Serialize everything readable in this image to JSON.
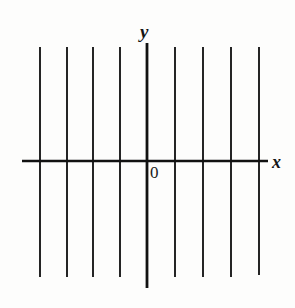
{
  "figure": {
    "width": 295,
    "height": 308,
    "background_color": "#fdfdfc",
    "ink_color": "#1a1a1a",
    "axis_color": "#111111"
  },
  "labels": {
    "y_axis": "y",
    "x_axis": "x",
    "origin": "0"
  },
  "chart_data": {
    "type": "line",
    "title": "",
    "subtitle": "",
    "xlabel": "x",
    "ylabel": "y",
    "grid": false,
    "legend": null,
    "legend_position": "none",
    "axes": {
      "origin_label": "0",
      "x_axis": {
        "label": "x",
        "pixel_y": 161,
        "pixel_x_start": 22,
        "pixel_x_end": 268,
        "arrow": false
      },
      "y_axis": {
        "label": "y",
        "pixel_x": 147,
        "pixel_y_start": 43,
        "pixel_y_end": 288,
        "arrow": false
      }
    },
    "series": [
      {
        "name": "vertical lines",
        "orientation": "vertical",
        "count": 9,
        "spacing_px": 28,
        "x_pixels": [
          40,
          67,
          93,
          120,
          147,
          175,
          203,
          231,
          259
        ],
        "x_values": [
          -4,
          -3,
          -2,
          -1,
          0,
          1,
          2,
          3,
          4
        ],
        "y_top_px": 47,
        "y_bottom_px": 277
      }
    ],
    "lines": [
      {
        "id": "v-1",
        "x": 40,
        "y_top": 47,
        "y_bottom": 277,
        "is_axis": false,
        "width": 1.9
      },
      {
        "id": "v-2",
        "x": 67,
        "y_top": 47,
        "y_bottom": 277,
        "is_axis": false,
        "width": 1.9
      },
      {
        "id": "v-3",
        "x": 93,
        "y_top": 47,
        "y_bottom": 277,
        "is_axis": false,
        "width": 1.9
      },
      {
        "id": "v-4",
        "x": 120,
        "y_top": 47,
        "y_bottom": 277,
        "is_axis": false,
        "width": 1.9
      },
      {
        "id": "y-axis",
        "x": 147,
        "y_top": 43,
        "y_bottom": 288,
        "is_axis": true,
        "width": 2.8
      },
      {
        "id": "v-6",
        "x": 175,
        "y_top": 47,
        "y_bottom": 277,
        "is_axis": false,
        "width": 1.9
      },
      {
        "id": "v-7",
        "x": 203,
        "y_top": 47,
        "y_bottom": 277,
        "is_axis": false,
        "width": 1.9
      },
      {
        "id": "v-8",
        "x": 231,
        "y_top": 47,
        "y_bottom": 277,
        "is_axis": false,
        "width": 1.9
      },
      {
        "id": "v-9",
        "x": 259,
        "y_top": 47,
        "y_bottom": 275,
        "is_axis": false,
        "width": 1.9
      }
    ],
    "horizontal_lines": [
      {
        "id": "x-axis",
        "y": 161,
        "x_start": 22,
        "x_end": 268,
        "is_axis": true,
        "width": 2.4
      }
    ]
  }
}
